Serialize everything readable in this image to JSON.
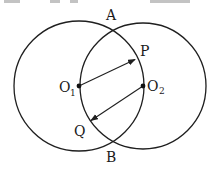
{
  "diagram": {
    "type": "two intersecting circles",
    "stroke_color": "#1f1f1f",
    "circles": [
      {
        "name": "O1",
        "cx": 79,
        "cy": 86,
        "r": 65
      },
      {
        "name": "O2",
        "cx": 143,
        "cy": 86,
        "r": 63
      }
    ],
    "points": {
      "A": {
        "label": "A",
        "x": 111,
        "y": 29
      },
      "B": {
        "label": "B",
        "x": 111,
        "y": 146
      },
      "P": {
        "label": "P",
        "x": 136,
        "y": 59
      },
      "Q": {
        "label": "Q",
        "x": 90,
        "y": 121
      },
      "O1": {
        "label": "O",
        "sub": "1",
        "x": 79,
        "y": 86
      },
      "O2": {
        "label": "O",
        "sub": "2",
        "x": 143,
        "y": 86
      }
    },
    "arrows": [
      {
        "from": "O1",
        "to": "P"
      },
      {
        "from": "O2",
        "to": "Q"
      }
    ]
  }
}
